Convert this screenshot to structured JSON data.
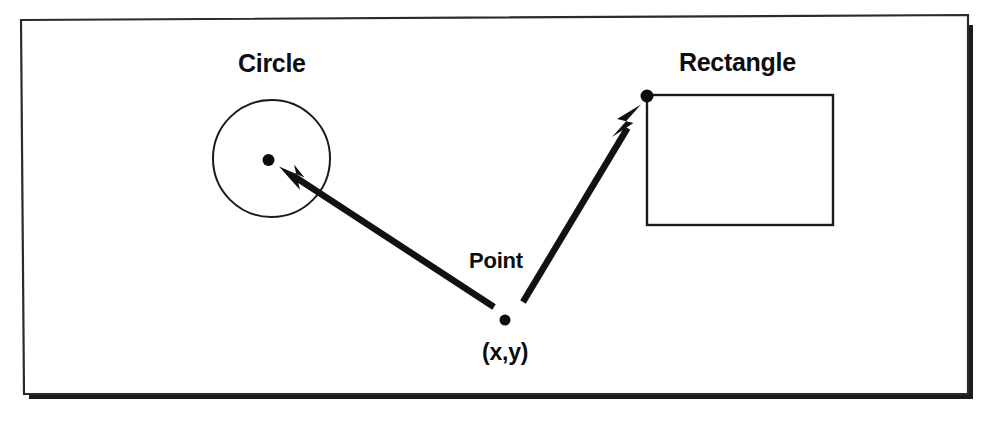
{
  "figure": {
    "canvas": {
      "width": 989,
      "height": 422
    },
    "colors": {
      "ink": "#0d0d0d",
      "stroke": "#1a1a1a",
      "background": "#ffffff",
      "frame": "#2b2b2b",
      "shadow": "#1c1c1c"
    }
  },
  "frame": {
    "name": "slide-border",
    "tilt_degrees": -0.35,
    "corners": {
      "top_left": [
        21,
        20
      ],
      "top_right": [
        968,
        15
      ],
      "bottom_right": [
        968,
        394
      ],
      "bottom_left": [
        24,
        394
      ]
    },
    "shadow_offset": [
      5,
      6
    ]
  },
  "labels": {
    "circle": {
      "text": "Circle",
      "x": 238,
      "y": 72
    },
    "rectangle": {
      "text": "Rectangle",
      "x": 679,
      "y": 71
    },
    "point": {
      "text": "Point",
      "x": 469,
      "y": 268
    },
    "coordinate": {
      "text": "(x,y)",
      "x": 482,
      "y": 360
    }
  },
  "shapes": {
    "circle": {
      "name": "circle-outline",
      "center_x": 271.5,
      "center_y": 158.5,
      "radius": 58.5,
      "stroke_width": 2
    },
    "rectangle": {
      "name": "rectangle-outline",
      "x": 647,
      "y": 95,
      "width": 186,
      "height": 130,
      "stroke_width": 2.4
    }
  },
  "points": [
    {
      "name": "origin-point",
      "label": "(x,y)",
      "x": 505,
      "y": 320,
      "radius": 5.5
    },
    {
      "name": "circle-center-point",
      "label": "Circle center",
      "x": 268.5,
      "y": 160,
      "radius": 6
    },
    {
      "name": "rectangle-anchor-point",
      "label": "Rectangle origin",
      "x": 647,
      "y": 96,
      "radius": 6.5
    }
  ],
  "arrows": [
    {
      "name": "arrow-to-circle",
      "from_x": 494,
      "from_y": 307,
      "to_x": 280,
      "to_y": 167,
      "stroke_width": 6.5,
      "head_length": 27,
      "head_width": 17
    },
    {
      "name": "arrow-to-rectangle",
      "from_x": 523,
      "from_y": 302,
      "to_x": 641,
      "to_y": 104,
      "stroke_width": 6.5,
      "head_length": 27,
      "head_width": 16
    }
  ]
}
